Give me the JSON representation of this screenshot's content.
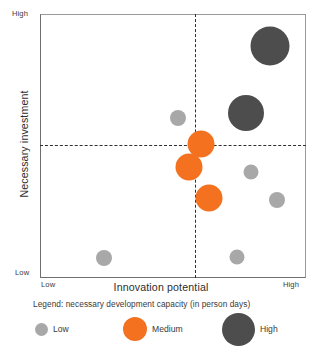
{
  "chart_data": {
    "type": "scatter",
    "title": "",
    "xlabel": "Innovation potential",
    "ylabel": "Necessary investment",
    "x_ticks": [
      "Low",
      "High"
    ],
    "y_ticks": [
      "Low",
      "High"
    ],
    "xlim": [
      0,
      100
    ],
    "ylim": [
      0,
      100
    ],
    "grid": false,
    "quadrant_lines": {
      "x": 58.2,
      "y": 50.4
    },
    "legend": {
      "title": "Legend: necessary development capacity (in person days)",
      "position": "below",
      "entries": [
        {
          "label": "Low",
          "color": "#a8a8a8",
          "size": 13
        },
        {
          "label": "Medium",
          "color": "#f4711f",
          "size": 24
        },
        {
          "label": "High",
          "color": "#4d4d4d",
          "size": 33
        }
      ]
    },
    "bubbles": [
      {
        "name": "bubble-high-1",
        "category": "High",
        "x": 86.7,
        "y": 88.3,
        "size": 39,
        "color": "#4d4d4d"
      },
      {
        "name": "bubble-high-2",
        "category": "High",
        "x": 77.8,
        "y": 62.5,
        "size": 36,
        "color": "#4d4d4d"
      },
      {
        "name": "bubble-medium-1",
        "category": "Medium",
        "x": 60.7,
        "y": 50.6,
        "size": 27,
        "color": "#f4711f"
      },
      {
        "name": "bubble-medium-2",
        "category": "Medium",
        "x": 56.0,
        "y": 42.0,
        "size": 27,
        "color": "#f4711f"
      },
      {
        "name": "bubble-medium-3",
        "category": "Medium",
        "x": 63.7,
        "y": 30.1,
        "size": 27,
        "color": "#f4711f"
      },
      {
        "name": "bubble-low-1",
        "category": "Low",
        "x": 51.9,
        "y": 60.6,
        "size": 16,
        "color": "#a8a8a8"
      },
      {
        "name": "bubble-low-2",
        "category": "Low",
        "x": 79.7,
        "y": 40.2,
        "size": 15,
        "color": "#a8a8a8"
      },
      {
        "name": "bubble-low-3",
        "category": "Low",
        "x": 89.5,
        "y": 29.5,
        "size": 16,
        "color": "#a8a8a8"
      },
      {
        "name": "bubble-low-4",
        "category": "Low",
        "x": 74.4,
        "y": 7.6,
        "size": 15,
        "color": "#a8a8a8"
      },
      {
        "name": "bubble-low-5",
        "category": "Low",
        "x": 23.7,
        "y": 7.2,
        "size": 16,
        "color": "#a8a8a8"
      }
    ]
  },
  "axes": {
    "x_title": "Innovation potential",
    "y_title": "Necessary investment",
    "x_low": "Low",
    "x_high": "High",
    "y_low": "Low",
    "y_high": "High"
  },
  "legend": {
    "title": "Legend: necessary development capacity (in person days)",
    "low_label": "Low",
    "medium_label": "Medium",
    "high_label": "High"
  },
  "colors": {
    "low": "#a8a8a8",
    "medium": "#f4711f",
    "high": "#4d4d4d",
    "frame": "#6f6f6f",
    "dash": "#2f2f2f"
  }
}
